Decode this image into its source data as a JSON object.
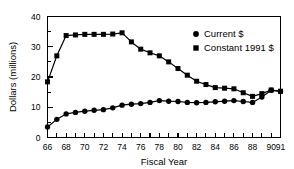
{
  "chart_data": {
    "type": "line",
    "title": "",
    "xlabel": "Fiscal  Year",
    "ylabel": "Dollars  (millions)",
    "xlim": [
      66,
      91
    ],
    "ylim": [
      0,
      40
    ],
    "grid": false,
    "legend_position": "top-right",
    "x": [
      66,
      67,
      68,
      69,
      70,
      71,
      72,
      73,
      74,
      75,
      76,
      77,
      78,
      79,
      80,
      81,
      82,
      83,
      84,
      85,
      86,
      87,
      88,
      89,
      90,
      91
    ],
    "x_tick_labels": [
      "66",
      "68",
      "70",
      "72",
      "74",
      "76",
      "78",
      "80",
      "82",
      "84",
      "86",
      "88",
      "90",
      "91"
    ],
    "x_tick_values": [
      66,
      68,
      70,
      72,
      74,
      76,
      78,
      80,
      82,
      84,
      86,
      88,
      90,
      91
    ],
    "y_tick_labels": [
      "0",
      "10",
      "20",
      "30",
      "40"
    ],
    "y_tick_values": [
      0,
      10,
      20,
      30,
      40
    ],
    "series": [
      {
        "name": "Current $",
        "marker": "circle",
        "values": [
          3.5,
          6.0,
          7.8,
          8.3,
          8.7,
          9.0,
          9.2,
          9.8,
          10.7,
          11.0,
          11.2,
          11.6,
          12.2,
          12.0,
          11.9,
          11.6,
          11.5,
          11.6,
          11.8,
          12.0,
          12.2,
          11.9,
          11.6,
          13.4,
          15.6,
          15.2
        ]
      },
      {
        "name": "Constant 1991 $",
        "marker": "square",
        "values": [
          18.4,
          27.0,
          33.7,
          33.9,
          34.1,
          34.1,
          34.1,
          34.2,
          34.6,
          31.6,
          29.2,
          28.0,
          27.0,
          25.0,
          22.8,
          20.6,
          18.6,
          17.5,
          16.5,
          16.3,
          16.1,
          14.8,
          13.6,
          14.5,
          15.7,
          15.3
        ]
      }
    ]
  },
  "legend": {
    "items": [
      {
        "label": "Current $",
        "marker": "circle"
      },
      {
        "label": "Constant 1991 $",
        "marker": "square"
      }
    ]
  }
}
